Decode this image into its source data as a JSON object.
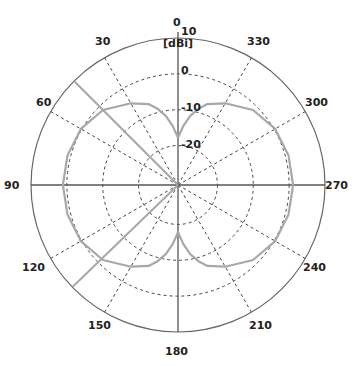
{
  "chart_data": {
    "type": "polar",
    "title": "",
    "unit_label": "[dBi]",
    "angle_direction": "counterclockwise",
    "angle_zero": "top",
    "angle_ticks": [
      0,
      30,
      60,
      90,
      120,
      150,
      180,
      210,
      240,
      270,
      300,
      330
    ],
    "radial_ticks": [
      10,
      0,
      -10,
      -20
    ],
    "radial_range": [
      -31,
      10
    ],
    "grid": true,
    "series": [
      {
        "name": "pattern",
        "color": "#a8a8a8",
        "angles": [
          0,
          5,
          10,
          15,
          20,
          30,
          45,
          60,
          75,
          90,
          105,
          120,
          135,
          150,
          160,
          165,
          170,
          175,
          180,
          185,
          190,
          195,
          200,
          210,
          225,
          240,
          255,
          270,
          285,
          300,
          315,
          330,
          340,
          345,
          350,
          355,
          360
        ],
        "values": [
          -17.8,
          -14.5,
          -11.4,
          -9.0,
          -7.0,
          -4.7,
          -1.4,
          0.3,
          0.9,
          1.1,
          0.9,
          0.3,
          -1.4,
          -4.7,
          -7.0,
          -9.0,
          -11.4,
          -14.5,
          -17.8,
          -14.5,
          -11.4,
          -9.0,
          -7.0,
          -4.7,
          -1.4,
          0.3,
          0.9,
          1.1,
          0.9,
          0.3,
          -1.4,
          -4.7,
          -7.0,
          -9.0,
          -11.4,
          -14.5,
          -17.8
        ]
      }
    ],
    "markers": [
      {
        "name": "beam-marker-upper",
        "angle": 45,
        "color": "#a8a8a8"
      },
      {
        "name": "beam-marker-lower",
        "angle": 134,
        "color": "#a8a8a8"
      }
    ]
  },
  "labels": {
    "unit": "[dBi]",
    "top_ring": "10",
    "angle_labels": [
      "0",
      "30",
      "60",
      "90",
      "120",
      "150",
      "180",
      "210",
      "240",
      "270",
      "300",
      "330"
    ],
    "ring_labels": [
      "0",
      "-10",
      "-20"
    ]
  },
  "colors": {
    "axis": "#555555",
    "grid": "#444444",
    "pattern": "#a8a8a8",
    "text": "#222222"
  }
}
